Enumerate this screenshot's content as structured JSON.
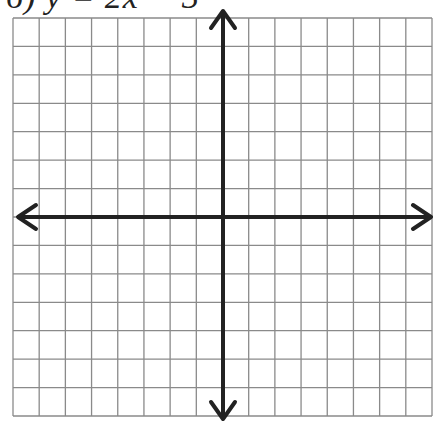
{
  "problem": {
    "label": "6) y = 2x − 3"
  },
  "graph": {
    "grid": {
      "left": 13,
      "top": 18,
      "right": 432,
      "bottom": 416,
      "columns": 16,
      "rows": 14,
      "line_color": "#8a8a8a"
    },
    "axes": {
      "x_axis_y": 217,
      "y_axis_x": 223,
      "color": "#222222",
      "arrows": [
        "left",
        "right",
        "up",
        "down"
      ]
    }
  }
}
